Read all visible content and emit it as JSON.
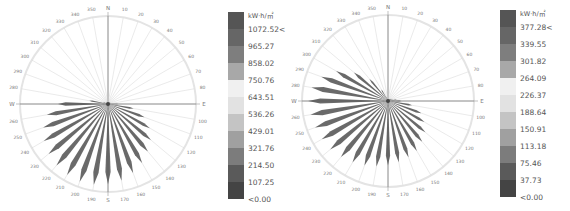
{
  "chart_data": [
    {
      "type": "radial-bar",
      "title": "",
      "unit": "kW·h/㎡",
      "directions_deg": [
        0,
        10,
        20,
        30,
        40,
        50,
        60,
        70,
        80,
        90,
        100,
        110,
        120,
        130,
        140,
        150,
        160,
        170,
        180,
        190,
        200,
        210,
        220,
        230,
        240,
        250,
        260,
        270,
        280,
        290,
        300,
        310,
        320,
        330,
        340,
        350
      ],
      "direction_labels": [
        "N",
        "10",
        "20",
        "30",
        "40",
        "50",
        "60",
        "70",
        "80",
        "E",
        "100",
        "110",
        "120",
        "130",
        "140",
        "150",
        "160",
        "170",
        "S",
        "190",
        "200",
        "210",
        "220",
        "230",
        "240",
        "250",
        "260",
        "W",
        "280",
        "290",
        "300",
        "310",
        "320",
        "330",
        "340",
        "350"
      ],
      "values": [
        5,
        10,
        10,
        15,
        20,
        25,
        30,
        35,
        40,
        120,
        300,
        450,
        560,
        650,
        720,
        790,
        850,
        900,
        930,
        950,
        960,
        950,
        930,
        900,
        860,
        800,
        720,
        580,
        220,
        60,
        20,
        15,
        10,
        10,
        5,
        5
      ],
      "legend": {
        "unit": "kW·h/㎡",
        "labels": [
          "1072.52<",
          "965.27",
          "858.02",
          "750.76",
          "643.51",
          "536.26",
          "429.01",
          "321.76",
          "214.50",
          "107.25",
          "<0.00"
        ],
        "colors": [
          "#555555",
          "#666666",
          "#7e7e7e",
          "#a8a8a8",
          "#f0f0f0",
          "#e2e2e2",
          "#c4c4c4",
          "#a0a0a0",
          "#7c7c7c",
          "#5a5a5a",
          "#444444"
        ]
      }
    },
    {
      "type": "radial-bar",
      "title": "",
      "unit": "kW·h/㎡",
      "directions_deg": [
        0,
        10,
        20,
        30,
        40,
        50,
        60,
        70,
        80,
        90,
        100,
        110,
        120,
        130,
        140,
        150,
        160,
        170,
        180,
        190,
        200,
        210,
        220,
        230,
        240,
        250,
        260,
        270,
        280,
        290,
        300,
        310,
        320,
        330,
        340,
        350
      ],
      "direction_labels": [
        "N",
        "10",
        "20",
        "30",
        "40",
        "50",
        "60",
        "70",
        "80",
        "E",
        "100",
        "110",
        "120",
        "130",
        "140",
        "150",
        "160",
        "170",
        "S",
        "190",
        "200",
        "210",
        "220",
        "230",
        "240",
        "250",
        "260",
        "W",
        "280",
        "290",
        "300",
        "310",
        "320",
        "330",
        "340",
        "350"
      ],
      "values": [
        5,
        5,
        8,
        10,
        12,
        15,
        20,
        25,
        40,
        60,
        110,
        160,
        190,
        220,
        240,
        260,
        270,
        280,
        290,
        300,
        310,
        320,
        330,
        340,
        345,
        350,
        355,
        360,
        350,
        320,
        270,
        200,
        130,
        60,
        20,
        10
      ],
      "legend": {
        "unit": "kW·h/㎡",
        "labels": [
          "377.28<",
          "339.55",
          "301.82",
          "264.09",
          "226.37",
          "188.64",
          "150.91",
          "113.18",
          "75.46",
          "37.73",
          "<0.00"
        ],
        "colors": [
          "#555555",
          "#666666",
          "#7e7e7e",
          "#a8a8a8",
          "#f0f0f0",
          "#e2e2e2",
          "#c4c4c4",
          "#a0a0a0",
          "#7c7c7c",
          "#5a5a5a",
          "#444444"
        ]
      }
    }
  ]
}
